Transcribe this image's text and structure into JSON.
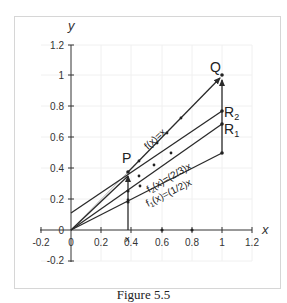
{
  "figure": {
    "caption": "Figure 5.5",
    "axes": {
      "x_label": "x",
      "y_label": "y",
      "x_ticks": [
        "-0.2",
        "0",
        "0.2",
        "0.4",
        "0.6",
        "0.8",
        "1",
        "1.2"
      ],
      "y_ticks": [
        "-0.2",
        "0",
        "0.2",
        "0.4",
        "0.6",
        "0.8",
        "1",
        "1.2"
      ],
      "x_marker_label": "x"
    },
    "points": {
      "P": "P",
      "Q": "Q",
      "R2": "R",
      "R2_sub": "2",
      "R1": "R",
      "R1_sub": "1"
    },
    "function_labels": {
      "identity": "f(x)=x",
      "f2": "f",
      "f2_sub": "2",
      "f2_rest": "(x)=(2/3)x",
      "f1": "f",
      "f1_sub": "1",
      "f1_rest": "(x)=(1/2)x"
    },
    "colors": {
      "line": "#2a2a2a",
      "grid": "#eeeeee",
      "frame": "#d0d0d0",
      "thin": "#9a9a9a"
    }
  }
}
